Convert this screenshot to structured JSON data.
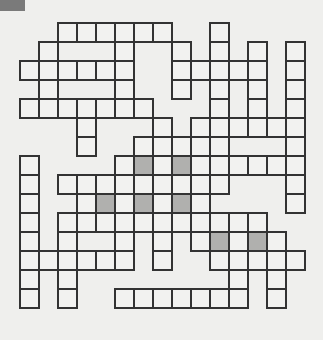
{
  "puzzle": {
    "type": "crossword",
    "cols": 15,
    "rows": 15,
    "cell_size": 19,
    "colors": {
      "background": "#efefed",
      "cell": "#f2f2f0",
      "shaded": "#b0b0ae",
      "border": "#333333",
      "corner_block": "#7a7a7a"
    },
    "rows_cells": [
      {
        "row": 0,
        "cells": [
          2,
          3,
          4,
          5,
          6,
          7,
          10
        ],
        "shaded": []
      },
      {
        "row": 1,
        "cells": [
          1,
          5,
          8,
          10,
          12,
          14
        ],
        "shaded": []
      },
      {
        "row": 2,
        "cells": [
          0,
          1,
          2,
          3,
          4,
          5,
          8,
          9,
          10,
          11,
          12,
          14
        ],
        "shaded": []
      },
      {
        "row": 3,
        "cells": [
          1,
          5,
          8,
          10,
          12,
          14
        ],
        "shaded": []
      },
      {
        "row": 4,
        "cells": [
          0,
          1,
          2,
          3,
          4,
          5,
          6,
          10,
          12,
          14
        ],
        "shaded": []
      },
      {
        "row": 5,
        "cells": [
          3,
          7,
          9,
          10,
          11,
          12,
          13,
          14
        ],
        "shaded": []
      },
      {
        "row": 6,
        "cells": [
          3,
          6,
          7,
          8,
          9,
          10,
          14
        ],
        "shaded": []
      },
      {
        "row": 7,
        "cells": [
          0,
          5,
          6,
          7,
          8,
          9,
          10,
          11,
          12,
          13,
          14
        ],
        "shaded": [
          6,
          8
        ]
      },
      {
        "row": 8,
        "cells": [
          0,
          2,
          3,
          4,
          5,
          6,
          7,
          8,
          9,
          10,
          14
        ],
        "shaded": []
      },
      {
        "row": 9,
        "cells": [
          0,
          3,
          4,
          5,
          6,
          7,
          8,
          9,
          14
        ],
        "shaded": [
          4,
          6,
          8
        ]
      },
      {
        "row": 10,
        "cells": [
          0,
          2,
          3,
          4,
          5,
          6,
          7,
          8,
          9,
          10,
          11,
          12
        ],
        "shaded": []
      },
      {
        "row": 11,
        "cells": [
          0,
          2,
          5,
          7,
          9,
          10,
          11,
          12,
          13
        ],
        "shaded": [
          10,
          12
        ]
      },
      {
        "row": 12,
        "cells": [
          0,
          1,
          2,
          3,
          4,
          5,
          7,
          10,
          11,
          12,
          13,
          14
        ],
        "shaded": []
      },
      {
        "row": 13,
        "cells": [
          0,
          2,
          11,
          13
        ],
        "shaded": []
      },
      {
        "row": 14,
        "cells": [
          0,
          2,
          5,
          6,
          7,
          8,
          9,
          10,
          11,
          13
        ],
        "shaded": []
      }
    ]
  }
}
